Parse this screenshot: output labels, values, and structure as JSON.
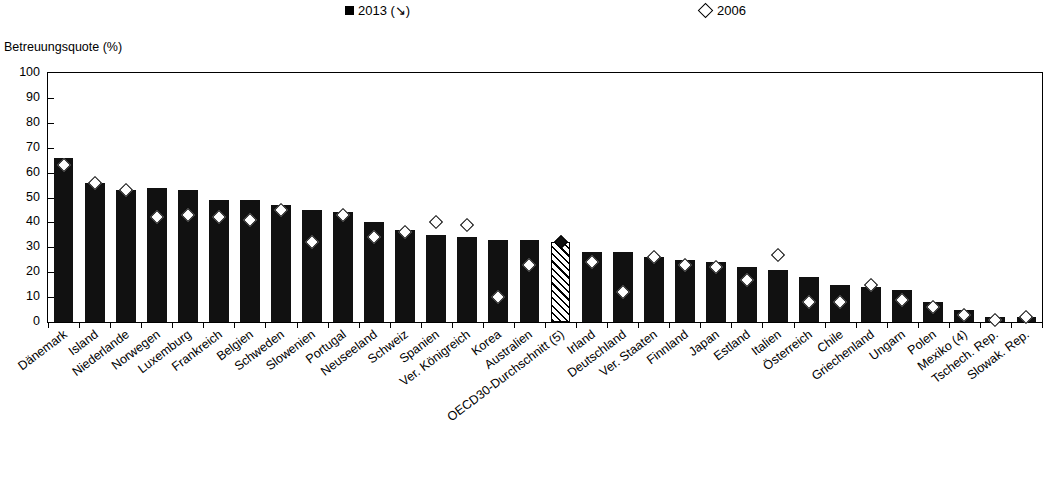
{
  "legend": {
    "series_2013_label": "2013 (↘)",
    "series_2006_label": "2006",
    "series_2013_icon": "filled-square-icon",
    "series_2006_icon": "open-diamond-icon"
  },
  "axis": {
    "y_title": "Betreuungsquote (%)",
    "y_ticks": [
      "100",
      "90",
      "80",
      "70",
      "60",
      "50",
      "40",
      "30",
      "20",
      "10",
      "0"
    ],
    "y_min": 0,
    "y_max": 100,
    "y_step": 10
  },
  "chart_data": {
    "type": "bar",
    "title": "Betreuungsquote (%)",
    "xlabel": "",
    "ylabel": "Betreuungsquote (%)",
    "ylim": [
      0,
      100
    ],
    "grid": false,
    "legend_position": "top",
    "sorted_by": "2013 descending",
    "categories": [
      "Dänemark",
      "Island",
      "Niederlande",
      "Norwegen",
      "Luxemburg",
      "Frankreich",
      "Belgien",
      "Schweden",
      "Slowenien",
      "Portugal",
      "Neuseeland",
      "Schweiz",
      "Spanien",
      "Ver. Königreich",
      "Korea",
      "Australien",
      "OECD30-Durchschnitt (5)",
      "Irland",
      "Deutschland",
      "Ver. Staaten",
      "Finnland",
      "Japan",
      "Estland",
      "Italien",
      "Österreich",
      "Chile",
      "Griechenland",
      "Ungarn",
      "Polen",
      "Mexiko (4)",
      "Tschech. Rep.",
      "Slowak. Rep."
    ],
    "series": [
      {
        "name": "2013 (↘)",
        "marker": "bar",
        "values": [
          66,
          56,
          53,
          54,
          53,
          49,
          49,
          47,
          45,
          44,
          40,
          37,
          35,
          34,
          33,
          33,
          32,
          28,
          28,
          26,
          25,
          24,
          22,
          21,
          18,
          15,
          14,
          13,
          8,
          5,
          2,
          2
        ]
      },
      {
        "name": "2006",
        "marker": "open-diamond",
        "values": [
          63,
          56,
          53,
          42,
          43,
          42,
          41,
          45,
          32,
          43,
          34,
          36,
          40,
          39,
          10,
          23,
          32,
          24,
          12,
          26,
          23,
          22,
          17,
          27,
          8,
          8,
          15,
          9,
          6,
          3,
          1,
          2
        ]
      }
    ],
    "highlighted_category": "OECD30-Durchschnitt (5)",
    "highlight_style": "hatched"
  }
}
